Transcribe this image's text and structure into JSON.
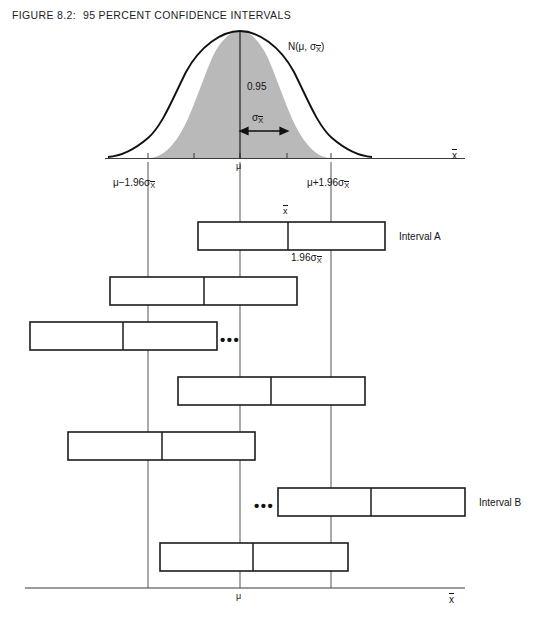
{
  "figure": {
    "number": "FIGURE 8.2:",
    "title": "95 PERCENT CONFIDENCE INTERVALS"
  },
  "colors": {
    "shade": "#b9b9b9",
    "curve": "#111111",
    "line": "#222222",
    "axis": "#3a3a3a",
    "text": "#141414"
  },
  "curve": {
    "distribution_label": {
      "prefix": "N(",
      "mu": "μ",
      "comma": ", ",
      "sigma": "σ",
      "subscript": "X",
      "suffix": ")"
    },
    "area_label": "0.95",
    "sigma_arrow": {
      "sigma": "σ",
      "subscript": "X"
    },
    "axis_label": "x",
    "mean_label": "μ",
    "lower_bound": {
      "mu": "μ",
      "op": "−",
      "coef": "1.96",
      "sigma": "σ",
      "subscript": "X"
    },
    "upper_bound": {
      "mu": "μ",
      "op": "+",
      "coef": "1.96",
      "sigma": "σ",
      "subscript": "X"
    }
  },
  "annotations": {
    "xbar_above_interval_a": "x",
    "half_width_label": {
      "coef": "1.96",
      "sigma": "σ",
      "subscript": "X"
    },
    "ellipsis": "•••"
  },
  "bottom_axis": {
    "mean_label": "μ",
    "axis_label": "x"
  },
  "intervals": [
    {
      "name": "Interval A",
      "label": "Interval A",
      "x1": 198,
      "x2": 385,
      "mid": 288,
      "y": 222,
      "has_label": true,
      "has_ellipsis": false
    },
    {
      "name": "interval-2",
      "label": "",
      "x1": 110,
      "x2": 297,
      "mid": 204,
      "y": 277,
      "has_label": false,
      "has_ellipsis": false
    },
    {
      "name": "interval-3",
      "label": "",
      "x1": 30,
      "x2": 217,
      "mid": 123,
      "y": 322,
      "has_label": false,
      "has_ellipsis": true
    },
    {
      "name": "interval-4",
      "label": "",
      "x1": 178,
      "x2": 365,
      "mid": 271,
      "y": 377,
      "has_label": false,
      "has_ellipsis": false
    },
    {
      "name": "interval-5",
      "label": "",
      "x1": 68,
      "x2": 255,
      "mid": 162,
      "y": 432,
      "has_label": false,
      "has_ellipsis": false
    },
    {
      "name": "Interval B",
      "label": "Interval B",
      "x1": 278,
      "x2": 465,
      "mid": 371,
      "y": 488,
      "has_label": true,
      "has_ellipsis": true
    },
    {
      "name": "interval-7",
      "label": "",
      "x1": 160,
      "x2": 348,
      "mid": 253,
      "y": 543,
      "has_label": false,
      "has_ellipsis": false
    }
  ],
  "chart_data": {
    "type": "diagram",
    "title": "95 Percent Confidence Intervals",
    "reference_lines": {
      "lower": 148,
      "center": 240,
      "upper": 331
    },
    "confidence_level": 0.95,
    "z_value": 1.96,
    "interval_count": 7,
    "labeled_intervals": [
      "Interval A",
      "Interval B"
    ]
  }
}
